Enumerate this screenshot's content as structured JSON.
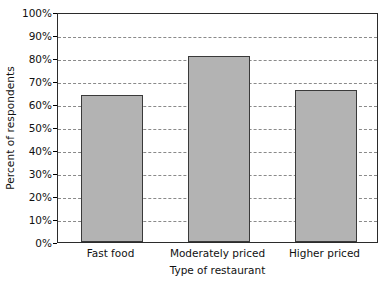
{
  "chart_data": {
    "type": "bar",
    "title": "",
    "categories": [
      "Fast food",
      "Moderately priced",
      "Higher priced"
    ],
    "values": [
      64,
      81,
      66
    ],
    "xlabel": "Type of restaurant",
    "ylabel": "Percent of respondents",
    "ylim": [
      0,
      100
    ],
    "ytick_labels": [
      "0%",
      "10%",
      "20%",
      "30%",
      "40%",
      "50%",
      "60%",
      "70%",
      "80%",
      "90%",
      "100%"
    ],
    "ytick_values": [
      0,
      10,
      20,
      30,
      40,
      50,
      60,
      70,
      80,
      90,
      100
    ],
    "grid": "horizontal-dashed",
    "legend": "none",
    "bar_color": "#b3b3b3",
    "bar_border_color": "#3a3a3a",
    "grid_color": "#8a8a8a",
    "axis_color": "#2b2b2b",
    "background": "#ffffff"
  }
}
